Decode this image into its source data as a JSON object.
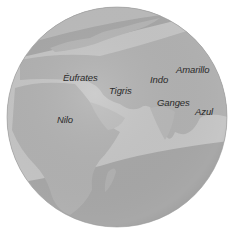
{
  "map": {
    "type": "globe",
    "colors": {
      "background": "#ffffff",
      "globe_base": "#b4b4b4",
      "band_light": "#c8c8c8",
      "polar_dark": "#9c9c9c",
      "land": "#aaaaaa",
      "label_text": "#2a2a2a"
    },
    "rivers": [
      {
        "name": "Éufrates",
        "x": 63,
        "y": 72
      },
      {
        "name": "Tigris",
        "x": 109,
        "y": 85
      },
      {
        "name": "Indo",
        "x": 150,
        "y": 74
      },
      {
        "name": "Amarillo",
        "x": 176,
        "y": 64
      },
      {
        "name": "Ganges",
        "x": 157,
        "y": 97
      },
      {
        "name": "Azul",
        "x": 195,
        "y": 106
      },
      {
        "name": "Nilo",
        "x": 57,
        "y": 114
      }
    ]
  }
}
